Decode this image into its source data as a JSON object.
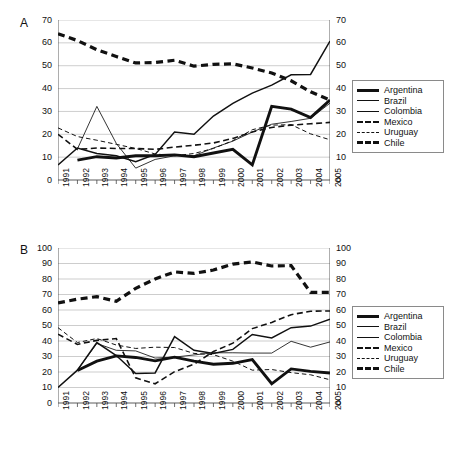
{
  "figure": {
    "panels": [
      {
        "letter": "A",
        "ylim": [
          0,
          70
        ],
        "yticks": [
          0,
          10,
          20,
          30,
          40,
          50,
          60,
          70
        ],
        "xticks": [
          "1991",
          "1992",
          "1993",
          "1994",
          "1995",
          "1996",
          "1997",
          "1998",
          "1999",
          "2000",
          "2001",
          "2002",
          "2003",
          "2004",
          "2005"
        ]
      },
      {
        "letter": "B",
        "ylim": [
          0,
          100
        ],
        "yticks": [
          0,
          10,
          20,
          30,
          40,
          50,
          60,
          70,
          80,
          90,
          100
        ],
        "xticks": [
          "1991",
          "1992",
          "1993",
          "1994",
          "1995",
          "1996",
          "1997",
          "1998",
          "1999",
          "2000",
          "2001",
          "2002",
          "2003",
          "2004",
          "2005"
        ]
      }
    ],
    "legend": {
      "entries": [
        {
          "label": "Argentina",
          "key": "k-argentina"
        },
        {
          "label": "Brazil",
          "key": "k-brazil"
        },
        {
          "label": "Colombia",
          "key": "k-colombia"
        },
        {
          "label": "Mexico",
          "key": "k-mexico"
        },
        {
          "label": "Uruguay",
          "key": "k-uruguay"
        },
        {
          "label": "Chile",
          "key": "k-chile"
        }
      ]
    }
  },
  "chart_data": [
    {
      "type": "line",
      "title": "A",
      "xlabel": "",
      "ylabel": "",
      "grid": true,
      "legend_position": "right",
      "xlim": [
        "1991",
        "2005"
      ],
      "ylim": [
        0,
        70
      ],
      "yticks": [
        0,
        10,
        20,
        30,
        40,
        50,
        60,
        70
      ],
      "dual_y_axis": true,
      "categories": [
        "1991",
        "1992",
        "1993",
        "1994",
        "1995",
        "1996",
        "1997",
        "1998",
        "1999",
        "2000",
        "2001",
        "2002",
        "2003",
        "2004",
        "2005"
      ],
      "series": [
        {
          "name": "Argentina",
          "style": "thick-solid",
          "values": [
            null,
            8.7,
            10.2,
            9.6,
            10.6,
            10.6,
            11.0,
            10.2,
            11.8,
            13.4,
            6.6,
            32.2,
            31.0,
            27.3,
            35.0
          ]
        },
        {
          "name": "Brazil",
          "style": "medium-solid",
          "values": [
            6.6,
            14.0,
            11.6,
            10.6,
            8.0,
            11.2,
            21.0,
            20.0,
            28.0,
            33.5,
            38.0,
            41.5,
            46.0,
            46.2,
            60.8
          ]
        },
        {
          "name": "Colombia",
          "style": "thin-solid",
          "values": [
            null,
            13.6,
            32.2,
            16.0,
            5.2,
            9.0,
            10.6,
            10.6,
            14.0,
            17.0,
            21.0,
            24.4,
            25.6,
            27.0,
            33.6
          ]
        },
        {
          "name": "Mexico",
          "style": "thick-dashed-medium",
          "values": [
            20.0,
            13.4,
            14.0,
            13.8,
            13.8,
            13.4,
            14.4,
            15.2,
            16.2,
            18.2,
            21.0,
            23.0,
            24.0,
            24.6,
            25.2
          ]
        },
        {
          "name": "Uruguay",
          "style": "thin-dashed",
          "values": [
            22.8,
            19.0,
            17.4,
            15.6,
            13.8,
            11.4,
            10.6,
            11.6,
            13.8,
            17.2,
            22.0,
            24.0,
            24.2,
            20.2,
            17.6
          ]
        },
        {
          "name": "Chile",
          "style": "thick-dashed",
          "values": [
            64.0,
            61.0,
            57.0,
            54.0,
            51.2,
            51.4,
            52.4,
            49.8,
            50.6,
            50.8,
            49.0,
            46.8,
            43.4,
            38.6,
            35.0
          ]
        }
      ]
    },
    {
      "type": "line",
      "title": "B",
      "xlabel": "",
      "ylabel": "",
      "grid": true,
      "legend_position": "right",
      "xlim": [
        "1991",
        "2005"
      ],
      "ylim": [
        0,
        100
      ],
      "yticks": [
        0,
        10,
        20,
        30,
        40,
        50,
        60,
        70,
        80,
        90,
        100
      ],
      "dual_y_axis": true,
      "categories": [
        "1991",
        "1992",
        "1993",
        "1994",
        "1995",
        "1996",
        "1997",
        "1998",
        "1999",
        "2000",
        "2001",
        "2002",
        "2003",
        "2004",
        "2005"
      ],
      "series": [
        {
          "name": "Argentina",
          "style": "thick-solid",
          "values": [
            null,
            21.0,
            27.0,
            30.4,
            29.4,
            27.2,
            29.6,
            27.0,
            25.0,
            25.6,
            28.0,
            12.4,
            22.0,
            20.4,
            19.4
          ]
        },
        {
          "name": "Brazil",
          "style": "medium-solid",
          "values": [
            10.0,
            21.2,
            39.0,
            30.6,
            19.0,
            19.4,
            42.8,
            34.0,
            32.0,
            34.6,
            44.2,
            42.0,
            48.6,
            49.6,
            54.0
          ]
        },
        {
          "name": "Colombia",
          "style": "thin-solid",
          "values": [
            null,
            21.4,
            38.4,
            34.0,
            33.6,
            29.0,
            29.6,
            31.0,
            32.4,
            32.4,
            32.2,
            32.2,
            39.8,
            36.0,
            39.4
          ]
        },
        {
          "name": "Mexico",
          "style": "thick-dashed-medium",
          "values": [
            44.4,
            37.8,
            40.4,
            41.6,
            16.2,
            12.4,
            20.2,
            25.0,
            33.2,
            38.6,
            48.0,
            52.0,
            57.0,
            59.2,
            59.4
          ]
        },
        {
          "name": "Uruguay",
          "style": "thin-dashed",
          "values": [
            48.6,
            39.0,
            41.6,
            37.4,
            35.2,
            36.0,
            35.8,
            32.0,
            31.2,
            27.0,
            21.2,
            21.6,
            19.6,
            18.2,
            15.0
          ]
        },
        {
          "name": "Chile",
          "style": "thick-dashed",
          "values": [
            64.6,
            67.0,
            68.6,
            65.6,
            74.0,
            80.0,
            84.6,
            83.6,
            85.8,
            89.6,
            91.0,
            88.4,
            88.6,
            71.4,
            71.4
          ]
        }
      ]
    }
  ]
}
